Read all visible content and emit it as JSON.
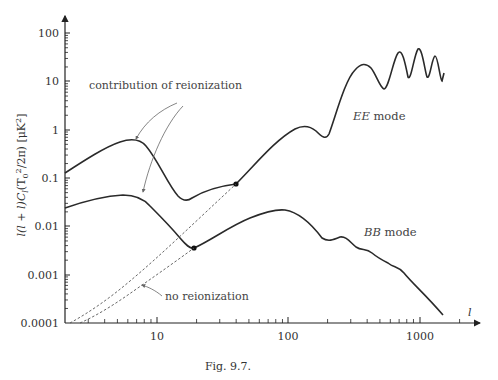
{
  "caption": "Fig. 9.7.",
  "axes": {
    "ylabel": "l(l + l)C_l (T_0^2/2π) [μK^2]",
    "xlabel": "l",
    "y_ticks": [
      "100",
      "10",
      "1",
      "0.1",
      "0.01",
      "0.001",
      "0.0001"
    ],
    "x_ticks": [
      "10",
      "100",
      "1000"
    ]
  },
  "annotations": {
    "reionization": "contribution of reionization",
    "no_reionization": "no reionization",
    "ee_label_it": "EE",
    "ee_label": " mode",
    "bb_label_it": "BB",
    "bb_label": " mode"
  },
  "chart_data": {
    "type": "line",
    "title": "",
    "caption": "Fig. 9.7.",
    "xlabel": "l",
    "ylabel": "l(l+1)C_l (T_0^2/2π) [μK^2]",
    "xscale": "log",
    "yscale": "log",
    "xlim": [
      2,
      2500
    ],
    "ylim": [
      0.0001,
      300
    ],
    "grid": false,
    "legend": "inline labels",
    "series": [
      {
        "name": "EE mode",
        "style": "solid",
        "x": [
          2,
          3,
          4,
          6,
          8,
          10,
          14,
          18,
          25,
          30,
          40,
          60,
          90,
          130,
          160,
          200,
          300,
          360,
          420,
          510,
          600,
          700,
          800,
          900,
          1000,
          1100,
          1300,
          1500
        ],
        "y": [
          0.12,
          0.22,
          0.35,
          0.55,
          0.5,
          0.3,
          0.06,
          0.032,
          0.045,
          0.055,
          0.065,
          0.18,
          0.5,
          1.2,
          0.6,
          1.0,
          15,
          20,
          10,
          5.5,
          20,
          30,
          10,
          40,
          25,
          9,
          30,
          12
        ]
      },
      {
        "name": "BB mode",
        "style": "solid",
        "x": [
          2,
          3,
          4,
          6,
          8,
          10,
          14,
          20,
          30,
          40,
          60,
          100,
          130,
          160,
          200,
          250,
          300,
          400,
          500,
          600,
          800,
          1000,
          1500
        ],
        "y": [
          0.022,
          0.028,
          0.033,
          0.038,
          0.036,
          0.03,
          0.012,
          0.0035,
          0.0065,
          0.01,
          0.016,
          0.018,
          0.012,
          0.0058,
          0.0045,
          0.005,
          0.0028,
          0.0016,
          0.0012,
          0.0008,
          0.00045,
          0.00028,
          0.00015
        ]
      },
      {
        "name": "EE no reionization",
        "style": "dashed",
        "x": [
          2,
          3,
          5,
          8,
          10,
          15,
          20,
          30,
          40
        ],
        "y": [
          0.0001,
          0.00013,
          0.0003,
          0.0008,
          0.0015,
          0.004,
          0.01,
          0.03,
          0.065
        ]
      },
      {
        "name": "BB no reionization",
        "style": "dashed",
        "x": [
          2.5,
          3,
          5,
          8,
          10,
          15,
          20
        ],
        "y": [
          0.0001,
          0.00011,
          0.00025,
          0.0006,
          0.0009,
          0.0021,
          0.0035
        ]
      }
    ],
    "markers": [
      {
        "series": "EE mode",
        "x": 40,
        "y": 0.065
      },
      {
        "series": "BB mode",
        "x": 20,
        "y": 0.0035
      }
    ],
    "annotations": [
      "contribution of reionization",
      "no reionization",
      "EE mode",
      "BB mode"
    ]
  }
}
